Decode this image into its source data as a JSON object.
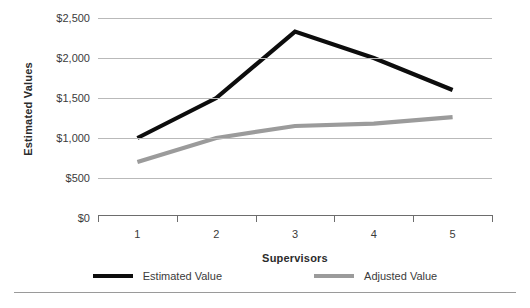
{
  "chart_data": {
    "type": "line",
    "title": "",
    "xlabel": "Supervisors",
    "ylabel": "Estimated Values",
    "categories": [
      "1",
      "2",
      "3",
      "4",
      "5"
    ],
    "ylim": [
      0,
      2500
    ],
    "ytick_values": [
      0,
      500,
      1000,
      1500,
      2000,
      2500
    ],
    "ytick_labels": [
      "$0",
      "$500",
      "$1,000",
      "$1,500",
      "$2,000",
      "$2,500"
    ],
    "grid": true,
    "legend_position": "bottom",
    "series": [
      {
        "name": "Estimated Value",
        "color": "#0d0d0d",
        "values": [
          1000,
          1500,
          2330,
          2000,
          1600
        ]
      },
      {
        "name": "Adjusted Value",
        "color": "#9b9b9b",
        "values": [
          700,
          1000,
          1150,
          1180,
          1260
        ]
      }
    ]
  },
  "colors": {
    "estimated": "#0d0d0d",
    "adjusted": "#9b9b9b",
    "gridline": "#b9b9b9",
    "axis": "#6d6d6d",
    "text": "#3b3b3b"
  }
}
